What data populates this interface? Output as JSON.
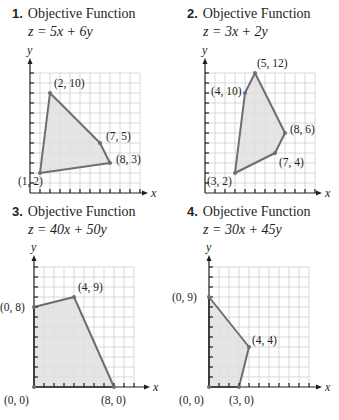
{
  "colors": {
    "grid": "#c9c9c9",
    "axis": "#231f20",
    "polygon_fill": "#e1e1e1",
    "polygon_stroke": "#6d6e71",
    "vertex": "#6d6e71",
    "text": "#231f20"
  },
  "panels": [
    {
      "number": "1.",
      "title": "Objective Function",
      "function": "z = 5x + 6y",
      "x_label": "x",
      "y_label": "y",
      "vertices": [
        {
          "x": 1,
          "y": 2,
          "label": "(1, 2)"
        },
        {
          "x": 2,
          "y": 10,
          "label": "(2, 10)"
        },
        {
          "x": 7,
          "y": 5,
          "label": "(7, 5)"
        },
        {
          "x": 8,
          "y": 3,
          "label": "(8, 3)"
        }
      ]
    },
    {
      "number": "2.",
      "title": "Objective Function",
      "function": "z = 3x + 2y",
      "x_label": "x",
      "y_label": "y",
      "vertices": [
        {
          "x": 3,
          "y": 2,
          "label": "(3, 2)"
        },
        {
          "x": 4,
          "y": 10,
          "label": "(4, 10)"
        },
        {
          "x": 5,
          "y": 12,
          "label": "(5, 12)"
        },
        {
          "x": 8,
          "y": 6,
          "label": "(8, 6)"
        },
        {
          "x": 7,
          "y": 4,
          "label": "(7, 4)"
        }
      ]
    },
    {
      "number": "3.",
      "title": "Objective Function",
      "function": "z = 40x + 50y",
      "x_label": "x",
      "y_label": "y",
      "vertices": [
        {
          "x": 0,
          "y": 0,
          "label": "(0, 0)"
        },
        {
          "x": 0,
          "y": 8,
          "label": "(0, 8)"
        },
        {
          "x": 4,
          "y": 9,
          "label": "(4, 9)"
        },
        {
          "x": 8,
          "y": 0,
          "label": "(8, 0)"
        }
      ]
    },
    {
      "number": "4.",
      "title": "Objective Function",
      "function": "z = 30x + 45y",
      "x_label": "x",
      "y_label": "y",
      "vertices": [
        {
          "x": 0,
          "y": 0,
          "label": "(0, 0)"
        },
        {
          "x": 0,
          "y": 9,
          "label": "(0, 9)"
        },
        {
          "x": 4,
          "y": 4,
          "label": "(4, 4)"
        },
        {
          "x": 3,
          "y": 0,
          "label": "(3, 0)"
        }
      ]
    }
  ],
  "chart_data": [
    {
      "type": "polygon-region",
      "title": "Objective Function z = 5x + 6y",
      "vertices": [
        [
          1,
          2
        ],
        [
          2,
          10
        ],
        [
          7,
          5
        ],
        [
          8,
          3
        ]
      ],
      "xlim": [
        0,
        11
      ],
      "ylim": [
        0,
        12
      ]
    },
    {
      "type": "polygon-region",
      "title": "Objective Function z = 3x + 2y",
      "vertices": [
        [
          3,
          2
        ],
        [
          4,
          10
        ],
        [
          5,
          12
        ],
        [
          8,
          6
        ],
        [
          7,
          4
        ]
      ],
      "xlim": [
        0,
        11
      ],
      "ylim": [
        0,
        12
      ]
    },
    {
      "type": "polygon-region",
      "title": "Objective Function z = 40x + 50y",
      "vertices": [
        [
          0,
          0
        ],
        [
          0,
          8
        ],
        [
          4,
          9
        ],
        [
          8,
          0
        ]
      ],
      "xlim": [
        0,
        10
      ],
      "ylim": [
        0,
        12
      ]
    },
    {
      "type": "polygon-region",
      "title": "Objective Function z = 30x + 45y",
      "vertices": [
        [
          0,
          0
        ],
        [
          0,
          9
        ],
        [
          4,
          4
        ],
        [
          3,
          0
        ]
      ],
      "xlim": [
        0,
        10
      ],
      "ylim": [
        0,
        12
      ]
    }
  ]
}
